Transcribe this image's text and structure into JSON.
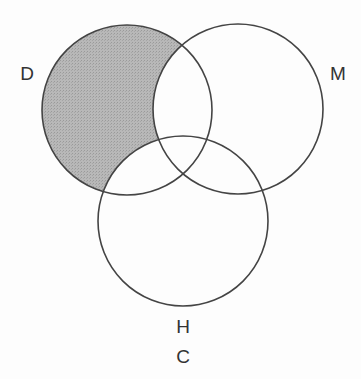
{
  "diagram": {
    "type": "venn",
    "sets": [
      {
        "id": "D",
        "label": "D",
        "cx": 127,
        "cy": 110,
        "r": 85,
        "label_x": 27,
        "label_y": 73
      },
      {
        "id": "M",
        "label": "M",
        "cx": 238,
        "cy": 109,
        "r": 85,
        "label_x": 338,
        "label_y": 73
      },
      {
        "id": "H",
        "label": "H",
        "cx": 183,
        "cy": 221,
        "r": 85,
        "label_x": 183,
        "label_y": 326
      }
    ],
    "caption": "C",
    "caption_x": 183,
    "caption_y": 356,
    "shaded_region": "D only (D minus M minus H)",
    "colors": {
      "shade": "#b3b3b3",
      "stroke": "#444444",
      "background": "#fdfdfd",
      "text": "#333333"
    }
  }
}
